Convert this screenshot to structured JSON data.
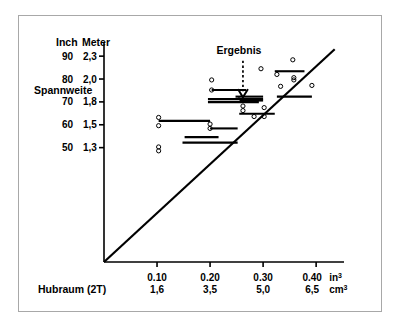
{
  "figure": {
    "background_color": "#ffffff",
    "frame_color": "#a8a8a8",
    "ink_color": "#000000"
  },
  "labels": {
    "y_header_inch": "Inch",
    "y_header_meter": "Meter",
    "y_axis_title": "Spannweite",
    "x_axis_title": "Hubraum (2T)",
    "x_unit_primary": "in",
    "x_unit_primary_sup": "3",
    "x_unit_secondary": "cm",
    "x_unit_secondary_sup": "3",
    "annotation": "Ergebnis"
  },
  "chart_data": {
    "type": "scatter",
    "title": "",
    "xlabel": "Hubraum (2T)",
    "ylabel": "Spannweite",
    "grid": false,
    "legend": false,
    "x_axis": {
      "unit_primary": "in³",
      "unit_secondary": "cm³",
      "ticks_primary": [
        "0.10",
        "0.20",
        "0.30",
        "0.40"
      ],
      "ticks_secondary": [
        "1,6",
        "3,5",
        "5,0",
        "6,5"
      ],
      "tick_values": [
        0.1,
        0.2,
        0.3,
        0.4
      ],
      "xlim": [
        0.0,
        0.445
      ]
    },
    "y_axis": {
      "unit_primary": "Inch",
      "unit_secondary": "Meter",
      "ticks_primary": [
        "90",
        "80",
        "70",
        "60",
        "50"
      ],
      "ticks_secondary": [
        "2,3",
        "2,0",
        "1,8",
        "1,5",
        "1,3"
      ],
      "tick_values": [
        90,
        80,
        70,
        60,
        50
      ],
      "ylim": [
        0,
        94
      ]
    },
    "trend_line": {
      "name": "Regressionsgerade",
      "x_start": 0.0,
      "y_start": 0.0,
      "x_end": 0.435,
      "y_end": 93.0
    },
    "annotation_marker": {
      "label": "Ergebnis",
      "x": 0.262,
      "y": 72.0,
      "arrow_from_y": 88.0,
      "arrow_style": "dotted-down-arrow"
    },
    "series": [
      {
        "name": "Messpunkte",
        "marker": "open-circle",
        "points": [
          {
            "x": 0.103,
            "y": 63.2
          },
          {
            "x": 0.103,
            "y": 59.6
          },
          {
            "x": 0.103,
            "y": 50.3
          },
          {
            "x": 0.103,
            "y": 48.6
          },
          {
            "x": 0.2,
            "y": 60.3
          },
          {
            "x": 0.2,
            "y": 58.4
          },
          {
            "x": 0.203,
            "y": 79.6
          },
          {
            "x": 0.203,
            "y": 75.2
          },
          {
            "x": 0.258,
            "y": 71.6
          },
          {
            "x": 0.262,
            "y": 68.2
          },
          {
            "x": 0.262,
            "y": 66.2
          },
          {
            "x": 0.283,
            "y": 63.6
          },
          {
            "x": 0.296,
            "y": 84.5
          },
          {
            "x": 0.302,
            "y": 67.5
          },
          {
            "x": 0.302,
            "y": 63.6
          },
          {
            "x": 0.326,
            "y": 82.0
          },
          {
            "x": 0.333,
            "y": 76.8
          },
          {
            "x": 0.356,
            "y": 88.4
          },
          {
            "x": 0.358,
            "y": 80.6
          },
          {
            "x": 0.358,
            "y": 79.6
          },
          {
            "x": 0.392,
            "y": 77.2
          }
        ]
      },
      {
        "name": "Spannweitenbereiche",
        "marker": "horizontal-bar",
        "bars": [
          {
            "x_start": 0.203,
            "x_end": 0.268,
            "y": 75.2
          },
          {
            "x_start": 0.196,
            "x_end": 0.3,
            "y": 71.2
          },
          {
            "x_start": 0.196,
            "x_end": 0.292,
            "y": 69.9
          },
          {
            "x_start": 0.248,
            "x_end": 0.3,
            "y": 72.3
          },
          {
            "x_start": 0.256,
            "x_end": 0.3,
            "y": 70.6
          },
          {
            "x_start": 0.326,
            "x_end": 0.392,
            "y": 72.3
          },
          {
            "x_start": 0.322,
            "x_end": 0.378,
            "y": 83.4
          },
          {
            "x_start": 0.255,
            "x_end": 0.322,
            "y": 64.8
          },
          {
            "x_start": 0.103,
            "x_end": 0.2,
            "y": 61.7
          },
          {
            "x_start": 0.2,
            "x_end": 0.252,
            "y": 58.4
          },
          {
            "x_start": 0.152,
            "x_end": 0.216,
            "y": 54.6
          },
          {
            "x_start": 0.148,
            "x_end": 0.252,
            "y": 52.2
          }
        ]
      }
    ]
  }
}
